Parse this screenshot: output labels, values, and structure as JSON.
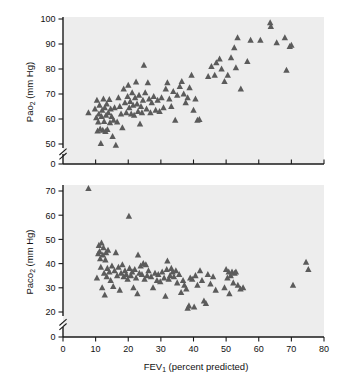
{
  "figure": {
    "background_color": "#ffffff",
    "plot_background_color": "#ededed",
    "marker_color": "#5b5b5b",
    "axis_color": "#1a1a1a"
  },
  "xaxis": {
    "label_main": "FEV",
    "label_sub": "1",
    "label_tail": " (percent predicted)",
    "label_full": "FEV1 (percent predicted)",
    "ticks": [
      "0",
      "10",
      "20",
      "30",
      "40",
      "50",
      "60",
      "70",
      "80"
    ],
    "min": 0,
    "max": 80
  },
  "panel_top": {
    "yaxis": {
      "label_main": "Pa",
      "label_o": "o",
      "label_sub": "2",
      "label_tail": " (mm Hg)",
      "label_full": "Pao2 (mm Hg)",
      "ticks": [
        "0",
        "50",
        "60",
        "70",
        "80",
        "90",
        "100"
      ],
      "axis_break": true,
      "min": 50,
      "max": 100
    }
  },
  "panel_bottom": {
    "yaxis": {
      "label_main": "Pa",
      "label_c": "c",
      "label_o": "o",
      "label_sub": "2",
      "label_tail": " (mm Hg)",
      "label_full": "Paco2 (mm Hg)",
      "ticks": [
        "0",
        "20",
        "30",
        "40",
        "50",
        "60",
        "70"
      ],
      "axis_break": true,
      "min": 20,
      "max": 70
    }
  },
  "chart_data": [
    {
      "type": "scatter",
      "panel": "top",
      "title": "",
      "xlabel": "FEV1 (percent predicted)",
      "ylabel": "Pao2 (mm Hg)",
      "xlim": [
        0,
        80
      ],
      "ylim": [
        45,
        100
      ],
      "ytick_values": [
        0,
        50,
        60,
        70,
        80,
        90,
        100
      ],
      "xtick_values": [
        0,
        10,
        20,
        30,
        40,
        50,
        60,
        70,
        80
      ],
      "y_axis_break": true,
      "grid": false,
      "legend": false,
      "marker": "triangle-up",
      "marker_color": "#5b5b5b",
      "points": [
        [
          7.8,
          62.5
        ],
        [
          9.8,
          64.0
        ],
        [
          10.2,
          60.5
        ],
        [
          10.4,
          67.5
        ],
        [
          10.6,
          55.2
        ],
        [
          10.8,
          58.8
        ],
        [
          11.0,
          62.0
        ],
        [
          11.2,
          65.5
        ],
        [
          11.4,
          56.0
        ],
        [
          11.6,
          50.2
        ],
        [
          11.8,
          61.0
        ],
        [
          12.0,
          63.5
        ],
        [
          12.2,
          55.5
        ],
        [
          12.4,
          68.0
        ],
        [
          12.6,
          59.0
        ],
        [
          12.8,
          64.5
        ],
        [
          13.0,
          55.0
        ],
        [
          13.2,
          61.5
        ],
        [
          13.4,
          66.0
        ],
        [
          13.6,
          55.8
        ],
        [
          13.9,
          62.5
        ],
        [
          14.2,
          67.8
        ],
        [
          14.4,
          58.5
        ],
        [
          14.6,
          64.0
        ],
        [
          14.9,
          61.0
        ],
        [
          15.2,
          53.0
        ],
        [
          15.5,
          59.5
        ],
        [
          15.8,
          64.5
        ],
        [
          16.2,
          49.5
        ],
        [
          16.6,
          58.8
        ],
        [
          17.0,
          68.5
        ],
        [
          17.4,
          65.0
        ],
        [
          17.8,
          62.0
        ],
        [
          18.2,
          56.5
        ],
        [
          18.6,
          72.0
        ],
        [
          19.0,
          66.5
        ],
        [
          19.4,
          62.5
        ],
        [
          19.8,
          69.0
        ],
        [
          20.0,
          73.5
        ],
        [
          20.3,
          64.5
        ],
        [
          20.6,
          67.0
        ],
        [
          20.9,
          62.0
        ],
        [
          21.2,
          70.5
        ],
        [
          21.5,
          65.5
        ],
        [
          21.8,
          61.5
        ],
        [
          22.1,
          68.5
        ],
        [
          22.4,
          74.8
        ],
        [
          22.7,
          66.0
        ],
        [
          23.0,
          63.0
        ],
        [
          23.3,
          69.5
        ],
        [
          23.6,
          58.0
        ],
        [
          23.9,
          65.0
        ],
        [
          24.2,
          62.5
        ],
        [
          24.5,
          67.5
        ],
        [
          24.8,
          81.5
        ],
        [
          25.2,
          70.5
        ],
        [
          25.6,
          64.0
        ],
        [
          26.0,
          74.5
        ],
        [
          26.4,
          68.0
        ],
        [
          26.8,
          62.5
        ],
        [
          27.2,
          66.5
        ],
        [
          27.8,
          69.0
        ],
        [
          28.4,
          63.5
        ],
        [
          29.0,
          67.5
        ],
        [
          29.6,
          63.0
        ],
        [
          30.2,
          68.5
        ],
        [
          30.8,
          64.5
        ],
        [
          31.5,
          72.0
        ],
        [
          32.0,
          74.5
        ],
        [
          32.6,
          68.0
        ],
        [
          33.2,
          65.0
        ],
        [
          33.8,
          71.0
        ],
        [
          34.4,
          59.5
        ],
        [
          35.0,
          69.5
        ],
        [
          35.8,
          73.0
        ],
        [
          36.4,
          75.0
        ],
        [
          37.0,
          70.0
        ],
        [
          37.6,
          66.5
        ],
        [
          38.2,
          68.5
        ],
        [
          38.8,
          72.5
        ],
        [
          39.4,
          77.5
        ],
        [
          40.0,
          63.5
        ],
        [
          40.6,
          68.0
        ],
        [
          41.2,
          59.5
        ],
        [
          41.8,
          59.8
        ],
        [
          44.5,
          77.0
        ],
        [
          45.5,
          81.0
        ],
        [
          46.5,
          77.5
        ],
        [
          47.0,
          82.5
        ],
        [
          48.0,
          84.0
        ],
        [
          48.6,
          80.0
        ],
        [
          49.5,
          75.0
        ],
        [
          50.5,
          77.5
        ],
        [
          51.5,
          84.5
        ],
        [
          52.5,
          88.5
        ],
        [
          53.0,
          80.5
        ],
        [
          53.5,
          92.5
        ],
        [
          54.5,
          72.0
        ],
        [
          56.5,
          83.0
        ],
        [
          57.5,
          91.5
        ],
        [
          60.5,
          91.5
        ],
        [
          63.5,
          98.5
        ],
        [
          63.7,
          97.0
        ],
        [
          65.5,
          90.5
        ],
        [
          68.0,
          92.5
        ],
        [
          68.5,
          79.5
        ],
        [
          69.5,
          89.0
        ],
        [
          70.0,
          89.5
        ]
      ]
    },
    {
      "type": "scatter",
      "panel": "bottom",
      "title": "",
      "xlabel": "FEV1 (percent predicted)",
      "ylabel": "Paco2 (mm Hg)",
      "xlim": [
        0,
        80
      ],
      "ylim": [
        20,
        72
      ],
      "ytick_values": [
        0,
        20,
        30,
        40,
        50,
        60,
        70
      ],
      "xtick_values": [
        0,
        10,
        20,
        30,
        40,
        50,
        60,
        70,
        80
      ],
      "y_axis_break": true,
      "grid": false,
      "legend": false,
      "marker": "triangle-up",
      "marker_color": "#5b5b5b",
      "points": [
        [
          7.8,
          71.0
        ],
        [
          10.4,
          34.0
        ],
        [
          10.8,
          44.0
        ],
        [
          11.0,
          47.5
        ],
        [
          11.2,
          45.0
        ],
        [
          11.4,
          42.0
        ],
        [
          11.6,
          38.5
        ],
        [
          11.8,
          48.5
        ],
        [
          12.0,
          30.0
        ],
        [
          12.2,
          43.5
        ],
        [
          12.4,
          46.5
        ],
        [
          12.6,
          36.0
        ],
        [
          12.8,
          27.0
        ],
        [
          13.0,
          41.5
        ],
        [
          13.2,
          44.5
        ],
        [
          13.4,
          34.5
        ],
        [
          13.6,
          38.0
        ],
        [
          13.8,
          45.5
        ],
        [
          14.2,
          36.5
        ],
        [
          14.6,
          33.0
        ],
        [
          15.0,
          39.0
        ],
        [
          15.4,
          30.5
        ],
        [
          15.8,
          37.0
        ],
        [
          16.2,
          44.5
        ],
        [
          16.6,
          35.0
        ],
        [
          17.0,
          38.5
        ],
        [
          17.4,
          29.0
        ],
        [
          17.8,
          36.0
        ],
        [
          18.2,
          39.5
        ],
        [
          18.6,
          34.5
        ],
        [
          19.0,
          37.0
        ],
        [
          19.4,
          35.5
        ],
        [
          19.8,
          33.5
        ],
        [
          20.2,
          59.5
        ],
        [
          20.4,
          38.0
        ],
        [
          20.8,
          35.0
        ],
        [
          21.2,
          36.5
        ],
        [
          21.6,
          30.0
        ],
        [
          22.0,
          37.5
        ],
        [
          22.4,
          34.0
        ],
        [
          22.8,
          27.5
        ],
        [
          23.0,
          43.5
        ],
        [
          23.4,
          36.0
        ],
        [
          23.8,
          39.0
        ],
        [
          24.2,
          35.5
        ],
        [
          24.6,
          40.0
        ],
        [
          25.0,
          33.5
        ],
        [
          25.4,
          39.5
        ],
        [
          25.8,
          35.0
        ],
        [
          26.2,
          37.0
        ],
        [
          27.0,
          34.5
        ],
        [
          27.6,
          30.0
        ],
        [
          28.2,
          36.0
        ],
        [
          28.8,
          33.0
        ],
        [
          29.2,
          35.5
        ],
        [
          29.8,
          32.5
        ],
        [
          30.4,
          36.5
        ],
        [
          31.0,
          34.0
        ],
        [
          31.4,
          26.5
        ],
        [
          31.8,
          37.5
        ],
        [
          32.0,
          41.0
        ],
        [
          32.4,
          33.5
        ],
        [
          32.8,
          35.0
        ],
        [
          33.2,
          38.0
        ],
        [
          33.6,
          36.5
        ],
        [
          34.0,
          34.5
        ],
        [
          34.6,
          37.0
        ],
        [
          35.0,
          32.0
        ],
        [
          35.6,
          35.5
        ],
        [
          36.2,
          28.0
        ],
        [
          36.8,
          33.0
        ],
        [
          37.2,
          31.0
        ],
        [
          37.8,
          29.5
        ],
        [
          38.2,
          21.5
        ],
        [
          38.6,
          22.5
        ],
        [
          39.0,
          34.0
        ],
        [
          39.6,
          33.5
        ],
        [
          40.2,
          22.0
        ],
        [
          40.6,
          35.0
        ],
        [
          41.2,
          31.0
        ],
        [
          42.0,
          37.0
        ],
        [
          42.6,
          33.0
        ],
        [
          43.2,
          24.5
        ],
        [
          43.8,
          23.5
        ],
        [
          44.4,
          35.5
        ],
        [
          45.2,
          31.5
        ],
        [
          46.0,
          34.5
        ],
        [
          46.8,
          29.0
        ],
        [
          49.5,
          30.0
        ],
        [
          50.0,
          37.5
        ],
        [
          50.4,
          34.0
        ],
        [
          50.8,
          36.5
        ],
        [
          51.0,
          27.5
        ],
        [
          51.4,
          35.0
        ],
        [
          51.8,
          36.5
        ],
        [
          52.2,
          32.0
        ],
        [
          52.6,
          36.0
        ],
        [
          53.0,
          36.5
        ],
        [
          53.6,
          31.0
        ],
        [
          54.4,
          29.5
        ],
        [
          55.2,
          30.0
        ],
        [
          70.5,
          31.0
        ],
        [
          74.5,
          40.5
        ],
        [
          75.2,
          37.5
        ]
      ]
    }
  ]
}
